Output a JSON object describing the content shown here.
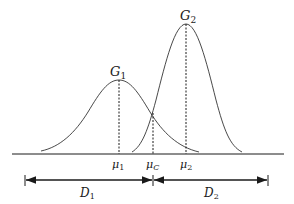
{
  "diagram": {
    "curves": [
      {
        "label": "G",
        "subscript": "1",
        "mean_label": "μ",
        "mean_subscript": "1"
      },
      {
        "label": "G",
        "subscript": "2",
        "mean_label": "μ",
        "mean_subscript": "2"
      }
    ],
    "crossing": {
      "label": "μ",
      "subscript": "C"
    },
    "segments": [
      {
        "label": "D",
        "subscript": "1"
      },
      {
        "label": "D",
        "subscript": "2"
      }
    ],
    "colors": {
      "stroke": "#1a1a1a",
      "background": "#ffffff"
    }
  }
}
